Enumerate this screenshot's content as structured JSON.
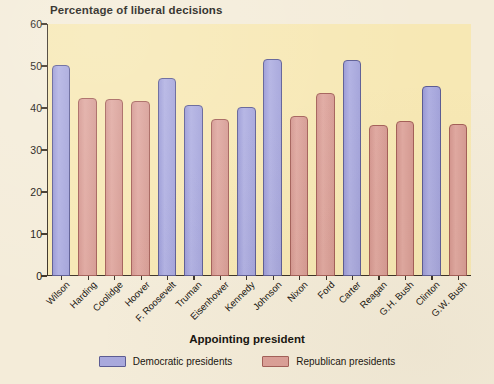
{
  "chart_data": {
    "type": "bar",
    "title": "Percentage of liberal decisions",
    "xlabel": "Appointing president",
    "ylabel": "",
    "ylim": [
      0,
      60
    ],
    "yticks": [
      0,
      10,
      20,
      30,
      40,
      50,
      60
    ],
    "grid": false,
    "legend_position": "bottom",
    "categories": [
      "Wilson",
      "Harding",
      "Coolidge",
      "Hoover",
      "F. Roosevelt",
      "Truman",
      "Eisenhower",
      "Kennedy",
      "Johnson",
      "Nixon",
      "Ford",
      "Carter",
      "Reagan",
      "G.H. Bush",
      "Clinton",
      "G.W. Bush"
    ],
    "values": [
      50.3,
      42.5,
      42.1,
      41.6,
      47.1,
      40.6,
      37.4,
      40.2,
      51.6,
      38.0,
      43.5,
      51.5,
      36.0,
      37.0,
      45.2,
      36.1
    ],
    "groups": [
      "Democratic",
      "Republican",
      "Republican",
      "Republican",
      "Democratic",
      "Democratic",
      "Republican",
      "Democratic",
      "Democratic",
      "Republican",
      "Republican",
      "Democratic",
      "Republican",
      "Republican",
      "Democratic",
      "Republican"
    ],
    "legend": [
      {
        "label": "Democratic presidents",
        "group": "Democratic",
        "color": "#a9a9dd"
      },
      {
        "label": "Republican presidents",
        "group": "Republican",
        "color": "#dca098"
      }
    ]
  },
  "colors": {
    "page_background": "#f4ecd9",
    "plot_background": "#f7e8b4",
    "axis": "#3a3126",
    "democratic_fill": "#a9a9dd",
    "democratic_stroke": "#5c5c93",
    "republican_fill": "#dca098",
    "republican_stroke": "#a35f58",
    "text": "#17140f"
  }
}
